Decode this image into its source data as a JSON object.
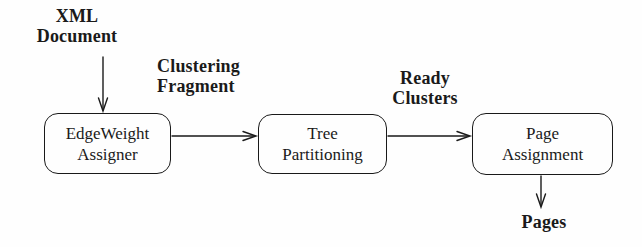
{
  "figure": {
    "background_color": "#fefefe",
    "ink_color": "#1a1a1a",
    "input_label": {
      "line1": "XML",
      "line2": "Document"
    },
    "nodes": [
      {
        "id": "edgeweight-assigner",
        "line1": "EdgeWeight",
        "line2": "Assigner"
      },
      {
        "id": "tree-partitioning",
        "line1": "Tree",
        "line2": "Partitioning"
      },
      {
        "id": "page-assignment",
        "line1": "Page",
        "line2": "Assignment"
      }
    ],
    "edge_labels": [
      {
        "line1": "Clustering",
        "line2": "Fragment"
      },
      {
        "line1": "Ready",
        "line2": "Clusters"
      }
    ],
    "output_label": "Pages"
  }
}
